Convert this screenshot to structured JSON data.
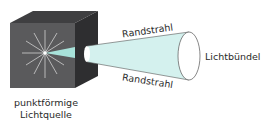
{
  "diagram": {
    "labels": {
      "source_line1": "punktförmige",
      "source_line2": "Lichtquelle",
      "edge_ray_top": "Randstrahl",
      "edge_ray_bottom": "Randstrahl",
      "bundle": "Lichtbündel"
    },
    "colors": {
      "cube_front": "#5a5a5c",
      "cube_top": "#3f3f41",
      "cube_side": "#2e2e30",
      "beam": "#d4f1ee",
      "beam_inner": "#a8e2da",
      "rays": "#d8d8d8",
      "outline": "#555555"
    }
  }
}
